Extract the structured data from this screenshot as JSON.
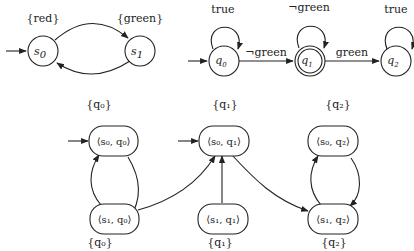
{
  "kripke": {
    "states": [
      {
        "id": "s0",
        "label": "s",
        "sub": "0",
        "props": "{red}",
        "initial": true
      },
      {
        "id": "s1",
        "label": "s",
        "sub": "1",
        "props": "{green}",
        "initial": false
      }
    ],
    "transitions": [
      {
        "from": "s0",
        "to": "s1"
      },
      {
        "from": "s1",
        "to": "s0"
      }
    ]
  },
  "automaton": {
    "states": [
      {
        "id": "q0",
        "label": "q",
        "sub": "0",
        "initial": true,
        "accepting": false,
        "self_loop": "true"
      },
      {
        "id": "q1",
        "label": "q",
        "sub": "1",
        "initial": false,
        "accepting": true,
        "self_loop": "¬green"
      },
      {
        "id": "q2",
        "label": "q",
        "sub": "2",
        "initial": false,
        "accepting": false,
        "self_loop": "true"
      }
    ],
    "transitions": [
      {
        "from": "q0",
        "to": "q1",
        "label": "¬green"
      },
      {
        "from": "q1",
        "to": "q2",
        "label": "green"
      }
    ]
  },
  "product": {
    "nodes": [
      {
        "id": "s0q0",
        "label": "⟨s₀, q₀⟩",
        "set": "{q₀}",
        "set_pos": "top",
        "initial": true
      },
      {
        "id": "s0q1",
        "label": "⟨s₀, q₁⟩",
        "set": "{q₁}",
        "set_pos": "top",
        "initial": true
      },
      {
        "id": "s0q2",
        "label": "⟨s₀, q₂⟩",
        "set": "{q₂}",
        "set_pos": "top",
        "initial": false
      },
      {
        "id": "s1q0",
        "label": "⟨s₁, q₀⟩",
        "set": "{q₀}",
        "set_pos": "bottom",
        "initial": false
      },
      {
        "id": "s1q1",
        "label": "⟨s₁, q₁⟩",
        "set": "{q₁}",
        "set_pos": "bottom",
        "initial": false
      },
      {
        "id": "s1q2",
        "label": "⟨s₁, q₂⟩",
        "set": "{q₂}",
        "set_pos": "bottom",
        "initial": false
      }
    ],
    "edges": [
      {
        "from": "s0q0",
        "to": "s1q0"
      },
      {
        "from": "s1q0",
        "to": "s0q0"
      },
      {
        "from": "s1q0",
        "to": "s0q1"
      },
      {
        "from": "s1q1",
        "to": "s0q1"
      },
      {
        "from": "s0q1",
        "to": "s1q2"
      },
      {
        "from": "s0q2",
        "to": "s1q2"
      },
      {
        "from": "s1q2",
        "to": "s0q2"
      }
    ]
  }
}
